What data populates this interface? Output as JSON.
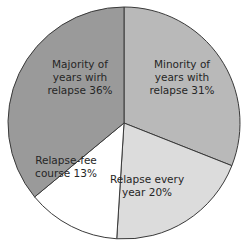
{
  "chart_data": {
    "type": "pie",
    "title": "",
    "start_angle_deg": 0,
    "direction": "clockwise",
    "slices": [
      {
        "name": "Minority of years with relapse",
        "value": 31,
        "color": "#b9b9b9",
        "label_lines": [
          "Minority of",
          "years with",
          "relapse 31%"
        ],
        "label_pos": [
          182,
          77
        ]
      },
      {
        "name": "Relapse every year",
        "value": 20,
        "color": "#dcdcdc",
        "label_lines": [
          "Relapse every",
          "year 20%"
        ],
        "label_pos": [
          147,
          185
        ]
      },
      {
        "name": "Relapse-fee course",
        "value": 13,
        "color": "#ffffff",
        "label_lines": [
          "Relapse-fee",
          "course 13%"
        ],
        "label_pos": [
          66,
          166
        ]
      },
      {
        "name": "Majority of years wirh relapse",
        "value": 36,
        "color": "#9a9a9a",
        "label_lines": [
          "Majority of",
          "years wirh",
          "relapse 36%"
        ],
        "label_pos": [
          80,
          77
        ]
      }
    ],
    "geometry": {
      "cx": 124,
      "cy": 123,
      "r": 116
    },
    "outline_color": "#3a3a3a"
  }
}
